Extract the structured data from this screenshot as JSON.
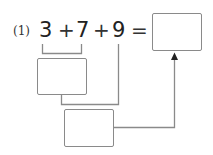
{
  "problem": {
    "number_label": "(1)",
    "terms": [
      "3",
      "7",
      "9"
    ],
    "operators": [
      "+",
      "+"
    ],
    "equals": "=",
    "answer_box_value": "",
    "intermediate_box_1_value": "",
    "intermediate_box_2_value": ""
  },
  "colors": {
    "line": "#8a8a8a",
    "text": "#222222"
  }
}
